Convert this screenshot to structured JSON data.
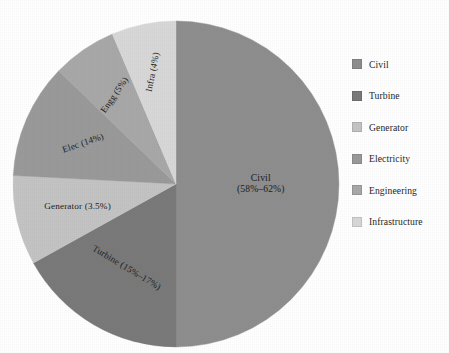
{
  "chart_data": {
    "type": "pie",
    "title": "",
    "subtitle": "",
    "xlabel": "",
    "ylabel": "",
    "legend_position": "right",
    "grid": false,
    "start_angle_deg": 0,
    "direction": "clockwise",
    "center": {
      "x": 176,
      "y": 184
    },
    "radius": 163,
    "categories": [
      "Civil",
      "Turbine",
      "Generator",
      "Electricity",
      "Engineering",
      "Infrastructure"
    ],
    "values": [
      50,
      17,
      9,
      11.5,
      6.5,
      6
    ],
    "slices": [
      {
        "key": "civil",
        "legend_label": "Civil",
        "slice_label": "Civil",
        "slice_value_label": "(58%–62%)",
        "percent_span": [
          58,
          62
        ],
        "sweep_deg": 180,
        "start_deg": 0,
        "end_deg": 180,
        "color": "#8e8e8e",
        "label_rotation_deg": 0,
        "label_radius_frac": 0.52
      },
      {
        "key": "turbine",
        "legend_label": "Turbine",
        "slice_label": "Turbine",
        "slice_value_label": "(15%–17%)",
        "percent_span": [
          15,
          17
        ],
        "sweep_deg": 61,
        "start_deg": 180,
        "end_deg": 241,
        "color": "#7a7a7a",
        "label_rotation_deg": 31,
        "label_radius_frac": 0.6
      },
      {
        "key": "generator",
        "legend_label": "Generator",
        "slice_label": "Generator",
        "slice_value_label": "(3.5%)",
        "percent_span": [
          3.5,
          3.5
        ],
        "sweep_deg": 32,
        "start_deg": 241,
        "end_deg": 273,
        "color": "#c4c4c4",
        "label_rotation_deg": 0,
        "label_radius_frac": 0.62
      },
      {
        "key": "electricity",
        "legend_label": "Electricity",
        "slice_label": "Elec",
        "slice_value_label": "(14%)",
        "percent_span": [
          14,
          14
        ],
        "sweep_deg": 41,
        "start_deg": 273,
        "end_deg": 314,
        "color": "#9a9a9a",
        "label_rotation_deg": -19,
        "label_radius_frac": 0.62
      },
      {
        "key": "engineering",
        "legend_label": "Engineering",
        "slice_label": "Engg",
        "slice_value_label": "(5%)",
        "percent_span": [
          5,
          5
        ],
        "sweep_deg": 23,
        "start_deg": 314,
        "end_deg": 337,
        "color": "#a8a8a8",
        "label_rotation_deg": -55,
        "label_radius_frac": 0.66
      },
      {
        "key": "infrastructure",
        "legend_label": "Infrastructure",
        "slice_label": "Infra",
        "slice_value_label": "(4%)",
        "percent_span": [
          4,
          4
        ],
        "sweep_deg": 23,
        "start_deg": 337,
        "end_deg": 360,
        "color": "#d8d8d8",
        "label_rotation_deg": -79,
        "label_radius_frac": 0.7
      }
    ]
  },
  "legend": {
    "items": [
      {
        "label": "Civil",
        "color": "#8e8e8e"
      },
      {
        "label": "Turbine",
        "color": "#7a7a7a"
      },
      {
        "label": "Generator",
        "color": "#c4c4c4"
      },
      {
        "label": "Electricity",
        "color": "#9a9a9a"
      },
      {
        "label": "Engineering",
        "color": "#a8a8a8"
      },
      {
        "label": "Infrastructure",
        "color": "#d8d8d8"
      }
    ]
  },
  "colors": {
    "background": "#ffffff",
    "text": "#1d1d1d",
    "civil": "#8e8e8e",
    "turbine": "#7a7a7a",
    "generator": "#c4c4c4",
    "electricity": "#9a9a9a",
    "engineering": "#a8a8a8",
    "infrastructure": "#d8d8d8"
  }
}
